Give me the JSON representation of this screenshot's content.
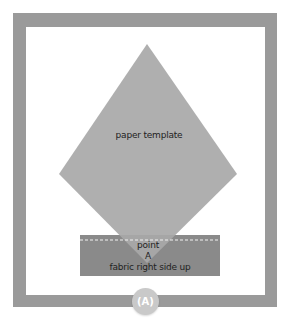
{
  "diagram": {
    "frame_color": "#9a9a9a",
    "template": {
      "label": "paper template",
      "shape": "diamond",
      "color": "#a6a6a6"
    },
    "fabric": {
      "label": "fabric right side up",
      "color": "#8a8a8a",
      "seam_line": "dashed white"
    },
    "point": {
      "label_line1": "point",
      "label_line2": "A"
    },
    "badge": {
      "label": "(A)",
      "color": "#c9c9c9"
    }
  }
}
